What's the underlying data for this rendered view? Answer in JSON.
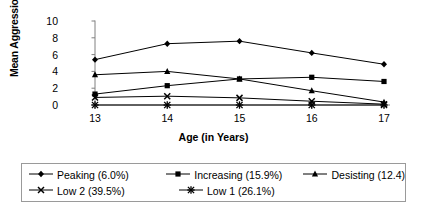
{
  "chart_data": {
    "type": "line",
    "title": "",
    "xlabel": "Age (in Years)",
    "ylabel": "Mean Aggression",
    "categories": [
      "13",
      "14",
      "15",
      "16",
      "17"
    ],
    "x": [
      13,
      14,
      15,
      16,
      17
    ],
    "xlim": [
      13,
      17
    ],
    "ylim": [
      0,
      10
    ],
    "yticks": [
      "0",
      "2",
      "4",
      "6",
      "8",
      "10"
    ],
    "ytick_values": [
      0,
      2,
      4,
      6,
      8,
      10
    ],
    "grid": false,
    "legend_position": "bottom",
    "series": [
      {
        "name": "Peaking (6.0%)",
        "label": "Peaking (6.0%)",
        "marker": "diamond",
        "values": [
          5.4,
          7.3,
          7.6,
          6.2,
          4.85
        ]
      },
      {
        "name": "Increasing (15.9%)",
        "label": "Increasing (15.9%)",
        "marker": "square",
        "values": [
          1.3,
          2.3,
          3.1,
          3.3,
          2.8
        ]
      },
      {
        "name": "Desisting (12.4)",
        "label": "Desisting (12.4)",
        "marker": "triangle",
        "values": [
          3.6,
          4.0,
          3.1,
          1.7,
          0.35
        ]
      },
      {
        "name": "Low 2 (39.5%)",
        "label": "Low 2 (39.5%)",
        "marker": "cross",
        "values": [
          0.9,
          1.05,
          0.85,
          0.45,
          0.1
        ]
      },
      {
        "name": "Low 1 (26.1%)",
        "label": "Low 1 (26.1%)",
        "marker": "star",
        "values": [
          0.0,
          0.0,
          0.0,
          0.0,
          0.0
        ]
      }
    ],
    "colors": {
      "series_line": "#000000",
      "axis": "#808080",
      "text": "#000000",
      "background": "#ffffff",
      "legend_border": "#9a9a9a"
    }
  }
}
